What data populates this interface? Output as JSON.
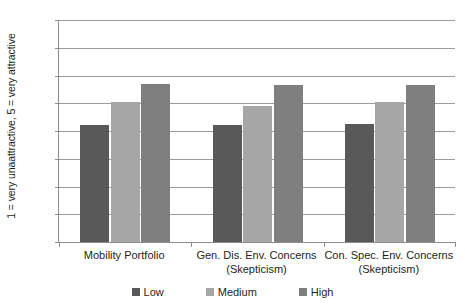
{
  "chart_data": {
    "type": "bar",
    "title": "",
    "subtitle": "",
    "xlabel": "",
    "ylabel": "1 = very unaattractive, 5 = very attractive",
    "ylim": [
      1.0,
      5.0
    ],
    "ytick_step": 0.5,
    "ytick_labels": [
      "5.00",
      "4.50",
      "4.00",
      "3.50",
      "3.00",
      "2.50",
      "2.00",
      "1.50",
      "1.00"
    ],
    "ytick_values": [
      5.0,
      4.5,
      4.0,
      3.5,
      3.0,
      2.5,
      2.0,
      1.5,
      1.0
    ],
    "grid": true,
    "grid_axis": "y",
    "legend_position": "bottom",
    "categories": [
      {
        "line1": "Mobility Portfolio",
        "line2": ""
      },
      {
        "line1": "Gen. Dis. Env. Concerns",
        "line2": "(Skepticism)"
      },
      {
        "line1": "Con. Spec. Env. Concerns",
        "line2": "(Skepticism)"
      }
    ],
    "category_labels": [
      "Mobility Portfolio",
      "Gen. Dis. Env. Concerns (Skepticism)",
      "Con. Spec. Env. Concerns (Skepticism)"
    ],
    "series": [
      {
        "name": "Low",
        "color": "#595959",
        "values": [
          3.1,
          3.1,
          3.12
        ]
      },
      {
        "name": "Medium",
        "color": "#a6a6a6",
        "values": [
          3.53,
          3.45,
          3.52
        ]
      },
      {
        "name": "High",
        "color": "#7f7f7f",
        "values": [
          3.85,
          3.82,
          3.82
        ]
      }
    ]
  },
  "legend": {
    "items": [
      {
        "label": "Low",
        "color": "#595959"
      },
      {
        "label": "Medium",
        "color": "#a6a6a6"
      },
      {
        "label": "High",
        "color": "#7f7f7f"
      }
    ]
  },
  "colors": {
    "axis": "#8c8c8c",
    "gridline": "#9b9b9b",
    "text": "#231f20",
    "background": "#ffffff"
  }
}
